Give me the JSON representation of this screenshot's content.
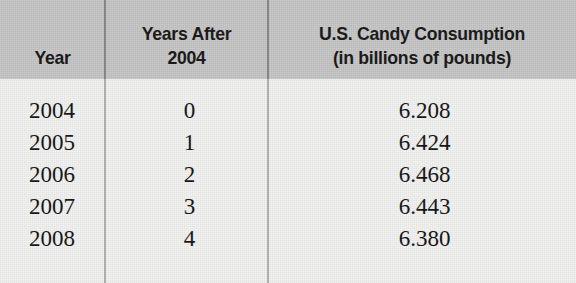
{
  "table": {
    "headers": [
      {
        "lines": [
          "Year"
        ]
      },
      {
        "lines": [
          "Years After",
          "2004"
        ]
      },
      {
        "lines": [
          "U.S. Candy Consumption",
          "(in billions of pounds)"
        ]
      }
    ],
    "rows": [
      {
        "year": "2004",
        "years_after": "0",
        "consumption": "6.208"
      },
      {
        "year": "2005",
        "years_after": "1",
        "consumption": "6.424"
      },
      {
        "year": "2006",
        "years_after": "2",
        "consumption": "6.468"
      },
      {
        "year": "2007",
        "years_after": "3",
        "consumption": "6.443"
      },
      {
        "year": "2008",
        "years_after": "4",
        "consumption": "6.380"
      }
    ]
  },
  "chart_data": {
    "type": "table",
    "title": "U.S. Candy Consumption",
    "columns": [
      "Year",
      "Years After 2004",
      "U.S. Candy Consumption (in billions of pounds)"
    ],
    "x": [
      0,
      1,
      2,
      3,
      4
    ],
    "categories": [
      "2004",
      "2005",
      "2006",
      "2007",
      "2008"
    ],
    "values": [
      6.208,
      6.424,
      6.468,
      6.443,
      6.38
    ],
    "xlabel": "Years After 2004",
    "ylabel": "U.S. Candy Consumption (in billions of pounds)",
    "units": "billions of pounds"
  },
  "colors": {
    "header_band": "#c3c3c3",
    "page_background": "#f1f1ef",
    "text": "#181818",
    "rule": "#5a5a5a"
  }
}
